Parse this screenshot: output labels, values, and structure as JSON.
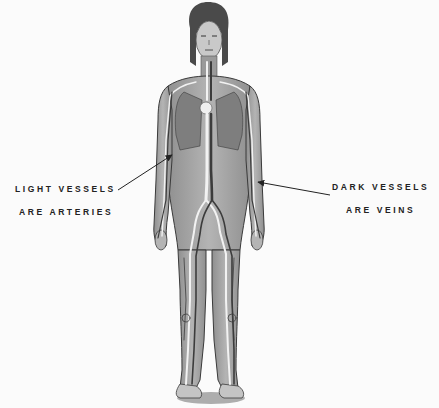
{
  "diagram": {
    "labels": {
      "left": {
        "line1": "LIGHT VESSELS",
        "line2": "ARE ARTERIES"
      },
      "right": {
        "line1": "DARK VESSELS",
        "line2": "ARE VEINS"
      }
    },
    "colors": {
      "background": "#fbfbfb",
      "body_fill": "#a9a9a9",
      "body_outline": "#3a3a3a",
      "artery": "#f2f2f2",
      "vein": "#3c3c3c",
      "text": "#222222"
    }
  }
}
